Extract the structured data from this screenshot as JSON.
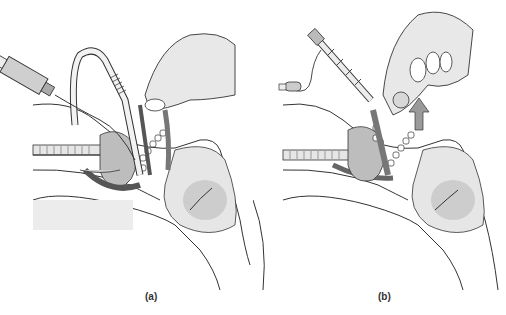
{
  "figure": {
    "panels": [
      {
        "id": "a",
        "label": "(a)",
        "elements": [
          "syringe",
          "endotracheal-tube",
          "hand",
          "laryngoscope",
          "patient-head-sagittal-section"
        ]
      },
      {
        "id": "b",
        "label": "(b)",
        "elements": [
          "endotracheal-tube",
          "pilot-balloon",
          "hand",
          "upward-arrow",
          "patient-head-sagittal-section"
        ]
      }
    ],
    "colors": {
      "background": "#ffffff",
      "line": "#333333",
      "fill_light": "#e6e6e6",
      "fill_mid": "#bdbdbd",
      "fill_dark": "#8a8a8a"
    }
  }
}
